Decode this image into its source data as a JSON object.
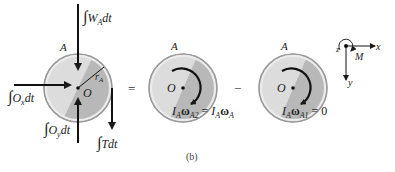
{
  "figure": {
    "caption": "(b)",
    "operators": {
      "equals": "=",
      "minus": "−"
    }
  },
  "disk_left": {
    "label": "A",
    "center_label": "O",
    "radius_label": "r",
    "radius_sub": "A",
    "forces": {
      "weight": {
        "int": "∫",
        "sym": "W",
        "sub": "A",
        "tail": "dt"
      },
      "ox": {
        "int": "∫",
        "sym": "O",
        "sub": "x",
        "tail": "dt"
      },
      "oy": {
        "int": "∫",
        "sym": "O",
        "sub": "y",
        "tail": "dt"
      },
      "tension": {
        "int": "∫",
        "sym": "Tdt"
      }
    }
  },
  "disk_middle": {
    "label": "A",
    "center_label": "O",
    "momentum": {
      "i": "I",
      "isub": "A",
      "w": "ω",
      "wsub": "A2",
      "eq": " = ",
      "i2": "I",
      "i2sub": "A",
      "w2": "ω",
      "w2sub": "A"
    }
  },
  "disk_right": {
    "label": "A",
    "center_label": "O",
    "momentum": {
      "i": "I",
      "isub": "A",
      "w": "ω",
      "wsub": "A1",
      "eq": " = 0"
    }
  },
  "axes": {
    "x": "x",
    "y": "y",
    "z": "z",
    "moment": "M"
  },
  "colors": {
    "disk_light": "#dcdcdc",
    "disk_dark": "#b4b4b4",
    "rim": "#a8a8a8",
    "ink": "#1a1a1a"
  }
}
